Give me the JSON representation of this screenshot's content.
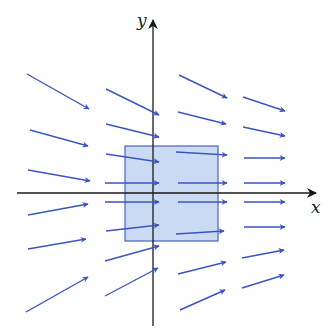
{
  "figure": {
    "width": 336,
    "height": 333,
    "colors": {
      "background": "#ffffff",
      "axis": "#1a1a1a",
      "arrow": "#3a55c0",
      "region_fill": "#c9daf2",
      "region_stroke": "#4a63c2"
    },
    "axes": {
      "origin": [
        153,
        193
      ],
      "x_axis": {
        "from": [
          17,
          193
        ],
        "to": [
          316,
          193
        ],
        "label": "x",
        "label_pos": [
          311,
          213
        ]
      },
      "y_axis": {
        "from": [
          153,
          326
        ],
        "to": [
          153,
          20
        ],
        "label": "y",
        "label_pos": [
          137,
          26
        ]
      }
    },
    "region": {
      "shape": "square",
      "x": 125,
      "y": 146,
      "width": 93,
      "height": 95
    },
    "arrows": [
      {
        "x1": 27,
        "y1": 74,
        "x2": 89,
        "y2": 109
      },
      {
        "x1": 30,
        "y1": 130,
        "x2": 88,
        "y2": 146
      },
      {
        "x1": 28,
        "y1": 170,
        "x2": 90,
        "y2": 181
      },
      {
        "x1": 28,
        "y1": 215,
        "x2": 88,
        "y2": 204
      },
      {
        "x1": 28,
        "y1": 249,
        "x2": 86,
        "y2": 239
      },
      {
        "x1": 26,
        "y1": 312,
        "x2": 88,
        "y2": 277
      },
      {
        "x1": 106,
        "y1": 89,
        "x2": 159,
        "y2": 115
      },
      {
        "x1": 106,
        "y1": 124,
        "x2": 159,
        "y2": 137
      },
      {
        "x1": 106,
        "y1": 154,
        "x2": 159,
        "y2": 162
      },
      {
        "x1": 105,
        "y1": 183,
        "x2": 159,
        "y2": 183
      },
      {
        "x1": 105,
        "y1": 202,
        "x2": 159,
        "y2": 202
      },
      {
        "x1": 106,
        "y1": 231,
        "x2": 159,
        "y2": 225
      },
      {
        "x1": 105,
        "y1": 261,
        "x2": 159,
        "y2": 246
      },
      {
        "x1": 105,
        "y1": 296,
        "x2": 158,
        "y2": 268
      },
      {
        "x1": 179,
        "y1": 75,
        "x2": 227,
        "y2": 98
      },
      {
        "x1": 178,
        "y1": 112,
        "x2": 226,
        "y2": 124
      },
      {
        "x1": 176,
        "y1": 152,
        "x2": 227,
        "y2": 155
      },
      {
        "x1": 178,
        "y1": 183,
        "x2": 227,
        "y2": 183
      },
      {
        "x1": 178,
        "y1": 202,
        "x2": 227,
        "y2": 202
      },
      {
        "x1": 176,
        "y1": 234,
        "x2": 224,
        "y2": 231
      },
      {
        "x1": 178,
        "y1": 274,
        "x2": 226,
        "y2": 262
      },
      {
        "x1": 180,
        "y1": 310,
        "x2": 225,
        "y2": 290
      },
      {
        "x1": 243,
        "y1": 97,
        "x2": 285,
        "y2": 111
      },
      {
        "x1": 243,
        "y1": 127,
        "x2": 285,
        "y2": 136
      },
      {
        "x1": 244,
        "y1": 158,
        "x2": 285,
        "y2": 158
      },
      {
        "x1": 244,
        "y1": 183,
        "x2": 285,
        "y2": 183
      },
      {
        "x1": 244,
        "y1": 202,
        "x2": 285,
        "y2": 202
      },
      {
        "x1": 244,
        "y1": 227,
        "x2": 285,
        "y2": 227
      },
      {
        "x1": 242,
        "y1": 258,
        "x2": 284,
        "y2": 250
      },
      {
        "x1": 242,
        "y1": 288,
        "x2": 284,
        "y2": 275
      }
    ]
  }
}
